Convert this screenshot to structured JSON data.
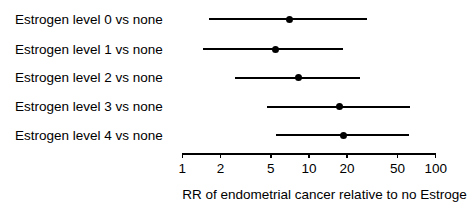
{
  "chart_data": {
    "type": "scatter",
    "subtype": "forest-plot",
    "title": "",
    "xlabel": "RR of endometrial cancer relative to no Estrogen",
    "ylabel": "",
    "xscale": "log",
    "xlim": [
      1,
      100
    ],
    "grid": false,
    "legend": null,
    "xticks": [
      {
        "value": 1,
        "label": "1"
      },
      {
        "value": 2,
        "label": "2"
      },
      {
        "value": 5,
        "label": "5"
      },
      {
        "value": 10,
        "label": "10"
      },
      {
        "value": 20,
        "label": "20"
      },
      {
        "value": 50,
        "label": "50"
      },
      {
        "value": 100,
        "label": "100"
      }
    ],
    "categories": [
      "Estrogen level 0 vs none",
      "Estrogen level 1 vs none",
      "Estrogen level 2 vs none",
      "Estrogen level 3 vs none",
      "Estrogen level 4 vs none"
    ],
    "rows": [
      {
        "label": "Estrogen level 0 vs none",
        "estimate": 7.0,
        "ci_low": 1.63,
        "ci_high": 28.5
      },
      {
        "label": "Estrogen level 1 vs none",
        "estimate": 5.4,
        "ci_low": 1.46,
        "ci_high": 18.5
      },
      {
        "label": "Estrogen level 2 vs none",
        "estimate": 8.3,
        "ci_low": 2.62,
        "ci_high": 25.4
      },
      {
        "label": "Estrogen level 3 vs none",
        "estimate": 17.5,
        "ci_low": 4.68,
        "ci_high": 62.9
      },
      {
        "label": "Estrogen level 4 vs none",
        "estimate": 18.7,
        "ci_low": 5.5,
        "ci_high": 61.4
      }
    ],
    "values": [
      7.0,
      5.4,
      8.3,
      17.5,
      18.7
    ],
    "ci_low": [
      1.63,
      1.46,
      2.62,
      4.68,
      5.5
    ],
    "ci_high": [
      28.5,
      18.5,
      25.4,
      62.9,
      61.4
    ],
    "marker_color": "#000000",
    "line_color": "#000000",
    "axis_color": "#000000",
    "background_color": "#ffffff"
  },
  "layout": {
    "plot_left_px": 182.3,
    "px_per_decade": 126.7,
    "axis_y_px": 153,
    "row_y_px": [
      19,
      49,
      77.7,
      106.7,
      135.3
    ],
    "label_left_px": 15,
    "axis_title_y_px": 188
  }
}
